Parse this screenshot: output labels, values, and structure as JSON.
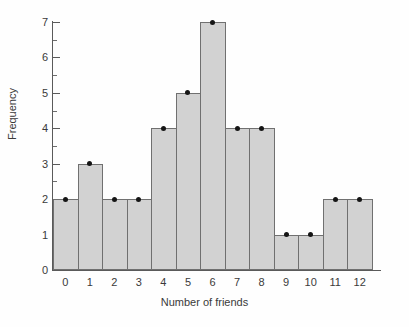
{
  "chart_data": {
    "type": "bar",
    "title": "",
    "subtitle": "",
    "xlabel": "Number of friends",
    "ylabel": "Frequency",
    "categories": [
      "0",
      "1",
      "2",
      "3",
      "4",
      "5",
      "6",
      "7",
      "8",
      "9",
      "10",
      "11",
      "12"
    ],
    "values": [
      2,
      3,
      2,
      2,
      4,
      5,
      7,
      4,
      4,
      1,
      1,
      2,
      2
    ],
    "point_markers": [
      2,
      3,
      2,
      2,
      4,
      5,
      7,
      4,
      4,
      1,
      1,
      2,
      2
    ],
    "ylim": [
      0,
      7
    ],
    "xlim": [
      -0.5,
      12.5
    ],
    "y_ticks": [
      0,
      1,
      2,
      3,
      4,
      5,
      6,
      7
    ],
    "y_tick_labels": [
      "0",
      "1",
      "2",
      "3",
      "4",
      "5",
      "6",
      "7"
    ],
    "y_minor_ticks": [
      0.5,
      1.5,
      2.5,
      3.5,
      4.5,
      5.5,
      6.5
    ],
    "x_tick_labels": [
      "0",
      "1",
      "2",
      "3",
      "4",
      "5",
      "6",
      "7",
      "8",
      "9",
      "10",
      "11",
      "12"
    ],
    "grid": false,
    "legend": null,
    "legend_position": "none",
    "bar_gap": 0,
    "colors": {
      "bar_fill": "#d2d2d2",
      "bar_edge": "#707070",
      "marker": "#151515",
      "axis": "#5a5a5a",
      "text": "#3a3a3a",
      "background": "#fefefe"
    }
  }
}
